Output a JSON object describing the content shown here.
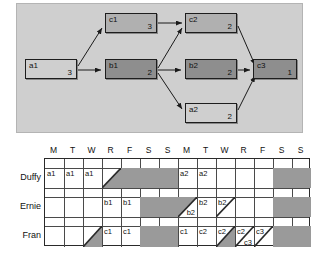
{
  "graph": {
    "nodes": [
      {
        "id": "a1",
        "label": "a1",
        "duration": "3",
        "shade": "light",
        "x": 8,
        "y": 55,
        "w": 52,
        "h": 20
      },
      {
        "id": "b1",
        "label": "b1",
        "duration": "2",
        "shade": "dark",
        "x": 88,
        "y": 55,
        "w": 52,
        "h": 20
      },
      {
        "id": "c1",
        "label": "c1",
        "duration": "3",
        "shade": "medium",
        "x": 88,
        "y": 9,
        "w": 52,
        "h": 20
      },
      {
        "id": "b2",
        "label": "b2",
        "duration": "2",
        "shade": "dark",
        "x": 168,
        "y": 55,
        "w": 52,
        "h": 20
      },
      {
        "id": "c2",
        "label": "c2",
        "duration": "2",
        "shade": "medium",
        "x": 168,
        "y": 9,
        "w": 52,
        "h": 20
      },
      {
        "id": "a2",
        "label": "a2",
        "duration": "2",
        "shade": "light",
        "x": 168,
        "y": 99,
        "w": 52,
        "h": 20
      },
      {
        "id": "c3",
        "label": "c3",
        "duration": "1",
        "shade": "dark",
        "x": 236,
        "y": 55,
        "w": 44,
        "h": 20
      }
    ],
    "edges": [
      {
        "from": "a1",
        "to": "c1"
      },
      {
        "from": "a1",
        "to": "b1"
      },
      {
        "from": "c1",
        "to": "c2"
      },
      {
        "from": "b1",
        "to": "c2"
      },
      {
        "from": "b1",
        "to": "b2"
      },
      {
        "from": "b1",
        "to": "a2"
      },
      {
        "from": "c2",
        "to": "c3"
      },
      {
        "from": "b2",
        "to": "c3"
      },
      {
        "from": "a2",
        "to": "c3"
      }
    ],
    "shade_colors": {
      "light": "#cfcfcf",
      "medium": "#b0b0b0",
      "dark": "#8e8e8e"
    },
    "panel_bg": "#cfcfcf"
  },
  "schedule": {
    "day_headers": [
      "M",
      "T",
      "W",
      "R",
      "F",
      "S",
      "S",
      "M",
      "T",
      "W",
      "R",
      "F",
      "S",
      "S"
    ],
    "rows": [
      {
        "name": "Duffy",
        "cells": [
          {
            "text": "a1"
          },
          {
            "text": "a1"
          },
          {
            "text": "a1"
          },
          {
            "text": "",
            "diag": "tl-to-br-lower"
          },
          {
            "text": "",
            "fill": "full"
          },
          {
            "text": "",
            "fill": "full"
          },
          {
            "text": "",
            "fill": "full"
          },
          {
            "text": "a2"
          },
          {
            "text": "a2"
          },
          {
            "text": ""
          },
          {
            "text": ""
          },
          {
            "text": ""
          },
          {
            "text": "",
            "fill": "full"
          },
          {
            "text": "",
            "fill": "full"
          }
        ]
      },
      {
        "name": "Ernie",
        "cells": [
          {
            "text": ""
          },
          {
            "text": ""
          },
          {
            "text": ""
          },
          {
            "text": "b1"
          },
          {
            "text": "b1"
          },
          {
            "text": "",
            "fill": "full"
          },
          {
            "text": "",
            "fill": "full"
          },
          {
            "text": "b2",
            "diag": "upper-left-shaded",
            "align": "br"
          },
          {
            "text": "b2"
          },
          {
            "text": "b2",
            "diag": "slash-open",
            "align": "tl"
          },
          {
            "text": ""
          },
          {
            "text": ""
          },
          {
            "text": "",
            "fill": "full"
          },
          {
            "text": "",
            "fill": "full"
          }
        ]
      },
      {
        "name": "Fran",
        "cells": [
          {
            "text": ""
          },
          {
            "text": ""
          },
          {
            "text": "",
            "diag": "lower-left-shaded"
          },
          {
            "text": "c1"
          },
          {
            "text": "c1"
          },
          {
            "text": "",
            "fill": "full"
          },
          {
            "text": "",
            "fill": "full"
          },
          {
            "text": "c1"
          },
          {
            "text": "c2"
          },
          {
            "text": "c2",
            "diag": "lower-right-shaded",
            "align": "tl"
          },
          {
            "text": "c2",
            "text2": "c3",
            "diag": "split",
            "align": "tl"
          },
          {
            "text": "c3",
            "diag": "slash-open",
            "align": "tl"
          },
          {
            "text": "",
            "fill": "full"
          },
          {
            "text": "",
            "fill": "full"
          }
        ]
      }
    ],
    "shade_color": "#9a9a9a"
  }
}
